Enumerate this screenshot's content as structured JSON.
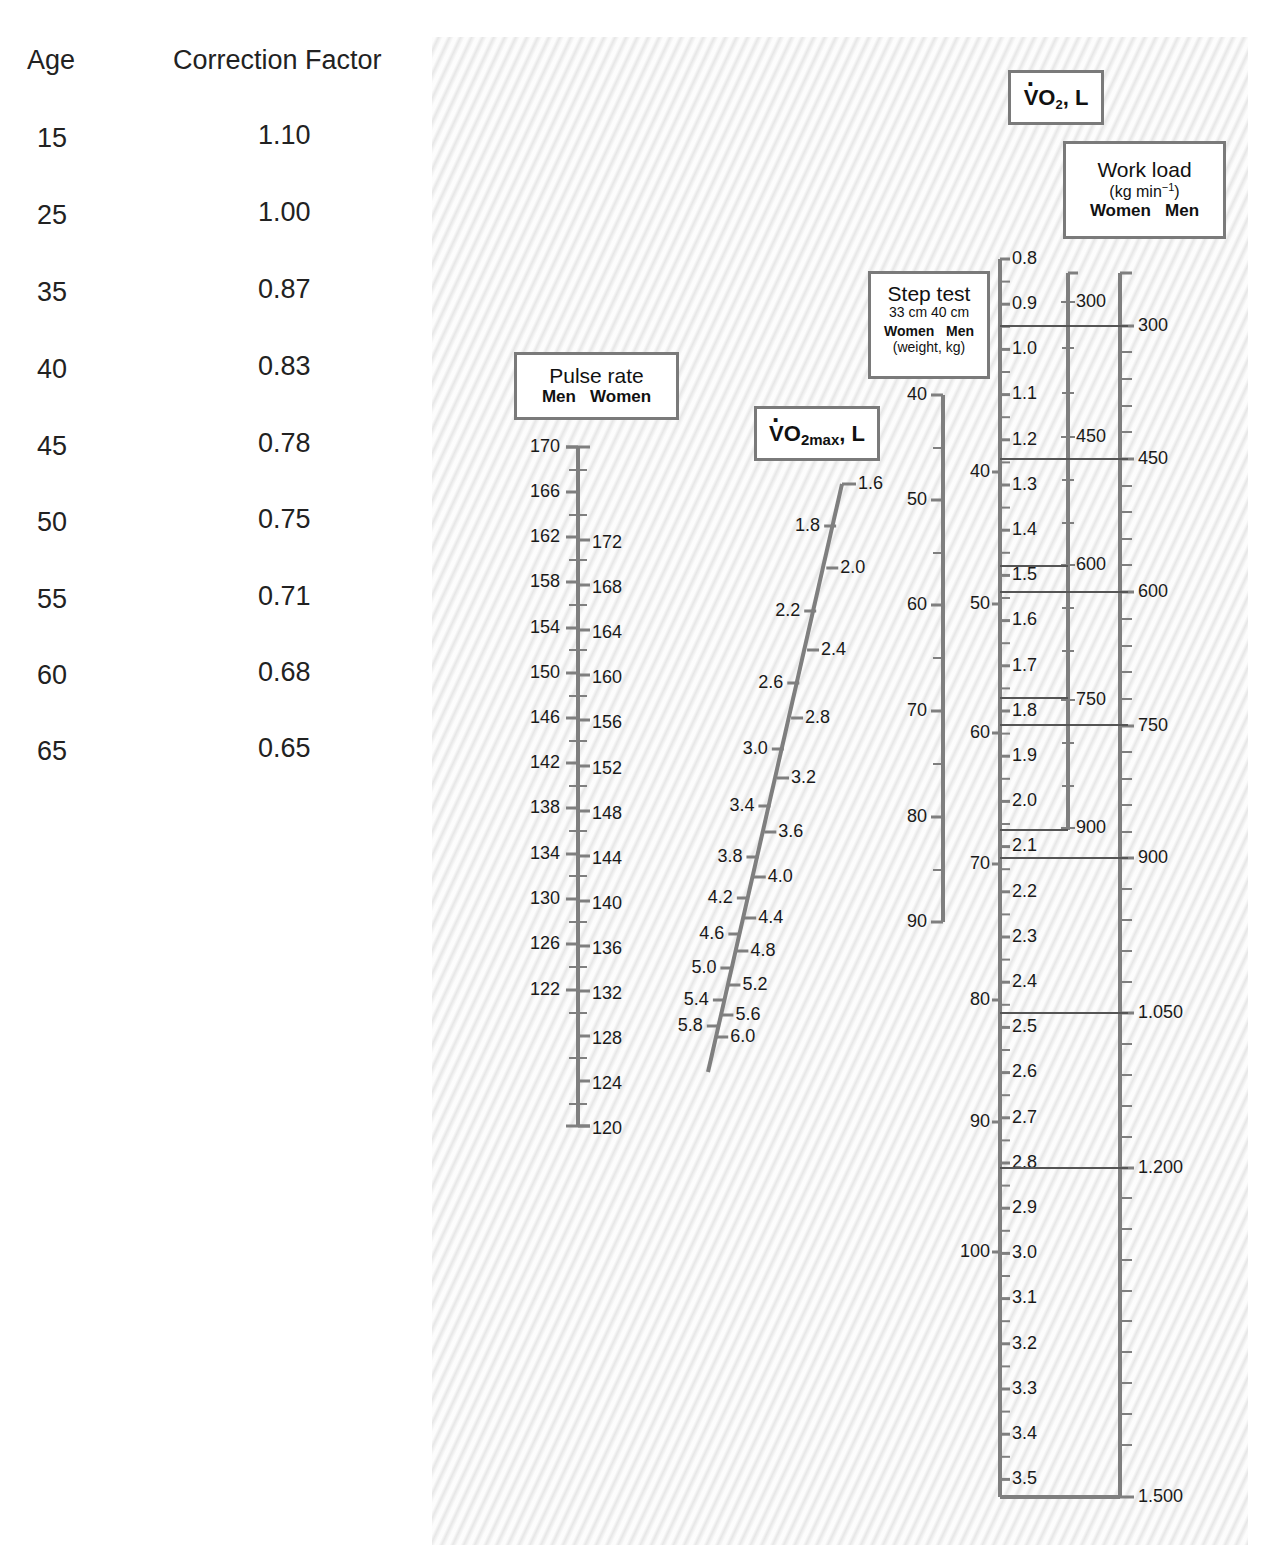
{
  "age_table": {
    "headers": [
      "Age",
      "Correction Factor"
    ],
    "rows": [
      {
        "age": "15",
        "factor": "1.10"
      },
      {
        "age": "25",
        "factor": "1.00"
      },
      {
        "age": "35",
        "factor": "0.87"
      },
      {
        "age": "40",
        "factor": "0.83"
      },
      {
        "age": "45",
        "factor": "0.78"
      },
      {
        "age": "50",
        "factor": "0.75"
      },
      {
        "age": "55",
        "factor": "0.71"
      },
      {
        "age": "60",
        "factor": "0.68"
      },
      {
        "age": "65",
        "factor": "0.65"
      }
    ]
  },
  "labels": {
    "pulse": {
      "title": "Pulse rate",
      "sub": "Men   Women"
    },
    "vo2max": {
      "v": "V",
      "o": "O",
      "sub": "2max",
      "unit": ", L"
    },
    "step": {
      "title": "Step test",
      "sub1": "33 cm  40 cm",
      "sub2": "Women   Men",
      "sub3": "(weight, kg)"
    },
    "vo2": {
      "v": "V",
      "o": "O",
      "sub": "2",
      "unit": ", L"
    },
    "workload": {
      "title": "Work load",
      "unit_pre": "(kg min",
      "unit_sup": "−1",
      "unit_post": ")",
      "sub": "Women   Men"
    }
  },
  "chart_data": {
    "type": "nomogram",
    "age_correction": {
      "age": [
        15,
        25,
        35,
        40,
        45,
        50,
        55,
        60,
        65
      ],
      "factor": [
        1.1,
        1.0,
        0.87,
        0.83,
        0.78,
        0.75,
        0.71,
        0.68,
        0.65
      ]
    },
    "scales": [
      {
        "name": "Pulse rate (Men)",
        "side": "left",
        "labels": [
          170,
          166,
          162,
          158,
          154,
          150,
          146,
          142,
          138,
          134,
          130,
          126,
          122
        ],
        "range": [
          120,
          170
        ],
        "tick_step": 2
      },
      {
        "name": "Pulse rate (Women)",
        "side": "right",
        "labels": [
          172,
          168,
          164,
          160,
          156,
          152,
          148,
          144,
          140,
          136,
          132,
          128,
          124,
          120
        ],
        "range": [
          120,
          172
        ]
      },
      {
        "name": "VO2max, L",
        "labels_left": [
          "1.8",
          "2.2",
          "2.6",
          "3.0",
          "3.4",
          "3.8",
          "4.2",
          "4.6",
          "5.0",
          "5.4",
          "5.8"
        ],
        "labels_right": [
          "1.6",
          "2.0",
          "2.4",
          "2.8",
          "3.2",
          "3.6",
          "4.0",
          "4.4",
          "4.8",
          "5.2",
          "5.6",
          "6.0"
        ],
        "range": [
          1.6,
          6.0
        ]
      },
      {
        "name": "Step test Women 33 cm (weight, kg)",
        "labels": [
          40,
          50,
          60,
          70,
          80,
          90
        ]
      },
      {
        "name": "Step test Men 40 cm (weight, kg)",
        "labels": [
          40,
          50,
          60,
          70,
          80,
          90,
          100
        ]
      },
      {
        "name": "VO2, L",
        "labels": [
          "0.8",
          "0.9",
          "1.0",
          "1.1",
          "1.2",
          "1.3",
          "1.4",
          "1.5",
          "1.6",
          "1.7",
          "1.8",
          "1.9",
          "2.0",
          "2.1",
          "2.2",
          "2.3",
          "2.4",
          "2.5",
          "2.6",
          "2.7",
          "2.8",
          "2.9",
          "3.0",
          "3.1",
          "3.2",
          "3.3",
          "3.4",
          "3.5"
        ],
        "range": [
          0.8,
          3.5
        ]
      },
      {
        "name": "Work load Women (kg min-1)",
        "labels": [
          "300",
          "450",
          "600",
          "750",
          "900"
        ]
      },
      {
        "name": "Work load Men (kg min-1)",
        "labels": [
          "300",
          "450",
          "600",
          "750",
          "900",
          "1.050",
          "1.200",
          "1.500"
        ]
      }
    ]
  },
  "nomogram": {
    "colors": {
      "axis": "#7f7f7f",
      "text": "#1a1a1a",
      "guide": "#555555"
    },
    "pulse": {
      "x": 578,
      "y_top": 447,
      "y_bottom": 1126,
      "men": [
        [
          "170",
          447
        ],
        [
          "166",
          492
        ],
        [
          "162",
          537
        ],
        [
          "158",
          582
        ],
        [
          "154",
          628
        ],
        [
          "150",
          673
        ],
        [
          "146",
          718
        ],
        [
          "142",
          763
        ],
        [
          "138",
          808
        ],
        [
          "134",
          854
        ],
        [
          "130",
          899
        ],
        [
          "126",
          944
        ],
        [
          "122",
          990
        ]
      ],
      "women": [
        [
          "172",
          540
        ],
        [
          "168",
          585
        ],
        [
          "164",
          630
        ],
        [
          "160",
          675
        ],
        [
          "156",
          720
        ],
        [
          "152",
          766
        ],
        [
          "148",
          811
        ],
        [
          "144",
          856
        ],
        [
          "140",
          901
        ],
        [
          "136",
          946
        ],
        [
          "132",
          991
        ],
        [
          "128",
          1036
        ],
        [
          "124",
          1081
        ],
        [
          "120",
          1126
        ]
      ],
      "minor": [
        470,
        515,
        560,
        605,
        650,
        696,
        741,
        786,
        831,
        876,
        922,
        967,
        1013,
        1058,
        1104
      ]
    },
    "vo2max": {
      "x1": 846,
      "y1": 484,
      "x2": 708,
      "y2": 1072,
      "left": [
        [
          "1.8",
          526
        ],
        [
          "2.2",
          611
        ],
        [
          "2.6",
          683
        ],
        [
          "3.0",
          749
        ],
        [
          "3.4",
          806
        ],
        [
          "3.8",
          857
        ],
        [
          "4.2",
          898
        ],
        [
          "4.6",
          934
        ],
        [
          "5.0",
          968
        ],
        [
          "5.4",
          1000
        ],
        [
          "5.8",
          1026
        ]
      ],
      "right": [
        [
          "1.6",
          484
        ],
        [
          "2.0",
          568
        ],
        [
          "2.4",
          650
        ],
        [
          "2.8",
          718
        ],
        [
          "3.2",
          778
        ],
        [
          "3.6",
          832
        ],
        [
          "4.0",
          877
        ],
        [
          "4.4",
          918
        ],
        [
          "4.8",
          951
        ],
        [
          "5.2",
          985
        ],
        [
          "5.6",
          1015
        ],
        [
          "6.0",
          1037
        ]
      ]
    },
    "step": {
      "x": 943,
      "y_top": 395,
      "y_bottom": 922,
      "women": [
        [
          "40",
          395
        ],
        [
          "50",
          500
        ],
        [
          "60",
          605
        ],
        [
          "70",
          711
        ],
        [
          "80",
          817
        ],
        [
          "90",
          922
        ]
      ],
      "minor": [
        448,
        553,
        658,
        764,
        870
      ],
      "men": [
        [
          "40",
          472
        ],
        [
          "50",
          604
        ],
        [
          "60",
          733
        ],
        [
          "70",
          864
        ],
        [
          "80",
          1000
        ],
        [
          "90",
          1122
        ],
        [
          "100",
          1252
        ]
      ]
    },
    "vo2": {
      "x": 1000,
      "y_top": 259,
      "y_bottom": 1497,
      "first": 0.8,
      "step_px": 45.2
    },
    "women_wl": {
      "x": 1068,
      "y_top": 273,
      "y_bottom": 830,
      "labels": [
        [
          "300",
          302
        ],
        [
          "450",
          437
        ],
        [
          "600",
          565
        ],
        [
          "750",
          700
        ],
        [
          "900",
          828
        ]
      ],
      "minor": [
        348,
        393,
        480,
        523,
        608,
        651,
        743,
        786
      ]
    },
    "men_wl": {
      "x": 1120,
      "y_top": 273,
      "y_bottom": 1497,
      "labels": [
        [
          "300",
          326
        ],
        [
          "450",
          459
        ],
        [
          "600",
          592
        ],
        [
          "750",
          726
        ],
        [
          "900",
          858
        ],
        [
          "1.050",
          1013
        ],
        [
          "1.200",
          1168
        ],
        [
          "1.500",
          1497
        ]
      ],
      "minor": [
        352,
        379,
        406,
        432,
        486,
        512,
        539,
        565,
        619,
        646,
        672,
        699,
        752,
        779,
        805,
        832,
        889,
        920,
        951,
        982,
        1044,
        1075,
        1106,
        1137,
        1198,
        1229,
        1260,
        1291,
        1321,
        1352,
        1383,
        1414,
        1445
      ]
    },
    "guides": [
      {
        "x1": 1000,
        "x2": 1128,
        "y": 326
      },
      {
        "x1": 1000,
        "x2": 1128,
        "y": 459
      },
      {
        "x1": 1000,
        "x2": 1068,
        "y": 566
      },
      {
        "x1": 1000,
        "x2": 1128,
        "y": 592
      },
      {
        "x1": 1000,
        "x2": 1068,
        "y": 698
      },
      {
        "x1": 1000,
        "x2": 1128,
        "y": 725
      },
      {
        "x1": 1000,
        "x2": 1068,
        "y": 830
      },
      {
        "x1": 1000,
        "x2": 1128,
        "y": 858
      },
      {
        "x1": 1000,
        "x2": 1128,
        "y": 1013
      },
      {
        "x1": 1000,
        "x2": 1128,
        "y": 1168
      }
    ]
  }
}
